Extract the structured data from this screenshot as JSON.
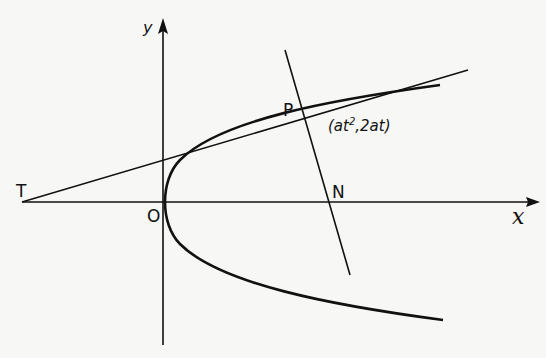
{
  "diagram": {
    "axes": {
      "x_label": "x",
      "y_label": "y"
    },
    "points": {
      "T": {
        "label": "T"
      },
      "O": {
        "label": "O"
      },
      "P": {
        "label": "P",
        "coordinates": "(at², 2at)"
      },
      "N": {
        "label": "N"
      }
    },
    "coord_label": {
      "open": "(at",
      "sup": "2",
      "rest": ",2at)"
    },
    "elements": [
      "parabola",
      "tangent line TP",
      "normal line through P and N",
      "x-axis",
      "y-axis"
    ],
    "colors": {
      "ink": "#111111",
      "paper": "#f7f7f5"
    }
  }
}
